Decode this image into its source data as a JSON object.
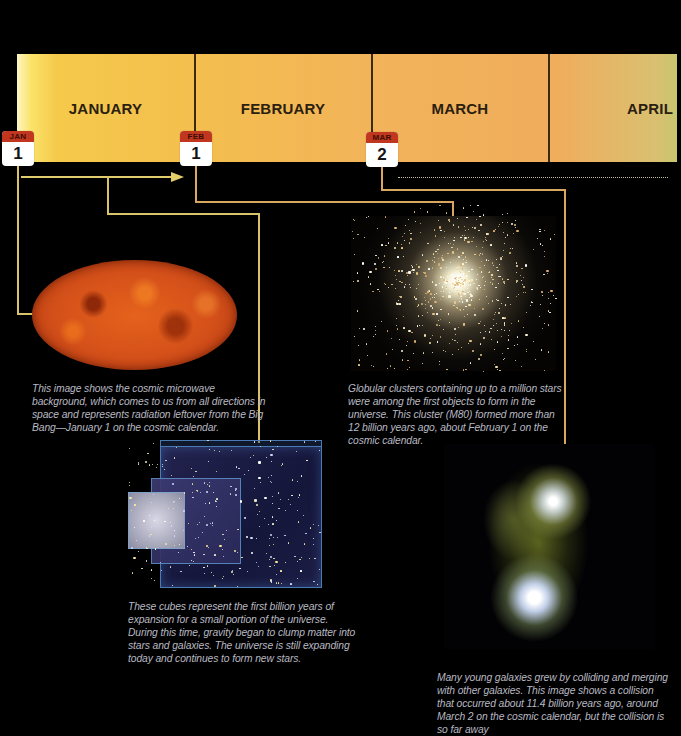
{
  "timeline": {
    "months": [
      {
        "label": "JANUARY"
      },
      {
        "label": "FEBRUARY"
      },
      {
        "label": "MARCH"
      },
      {
        "label": "APRIL"
      }
    ],
    "markers": [
      {
        "month": "JAN",
        "day": "1"
      },
      {
        "month": "FEB",
        "day": "1"
      },
      {
        "month": "MAR",
        "day": "2"
      }
    ]
  },
  "panels": {
    "cmb": {
      "image": "cosmic-microwave-background",
      "caption": "This image shows the cosmic microwave background, which comes to us from all directions in space and represents radiation leftover from the Big Bang—January 1 on the cosmic calendar."
    },
    "cluster": {
      "image": "globular-cluster-m80",
      "caption": "Globular clusters containing up to a million stars were among the first objects to form in the universe. This cluster (M80) formed more than 12 billion years ago, about February 1 on the cosmic calendar."
    },
    "cubes": {
      "image": "expanding-universe-cubes",
      "caption": "These cubes represent the first billion years of expansion for a small portion of the universe. During this time, gravity began to clump matter into stars and galaxies. The universe is still expanding today and continues to form new stars."
    },
    "galaxy": {
      "image": "colliding-galaxies",
      "caption": "Many young galaxies grew by colliding and merging with other galaxies. This image shows a collision that occurred about 11.4 billion years ago, around March 2 on the cosmic calendar, but the collision is so far away"
    }
  },
  "colors": {
    "background": "#000000",
    "connector": "#d8c36a",
    "badge_header": "#c0361e",
    "caption_text": "#b9b9c2"
  }
}
